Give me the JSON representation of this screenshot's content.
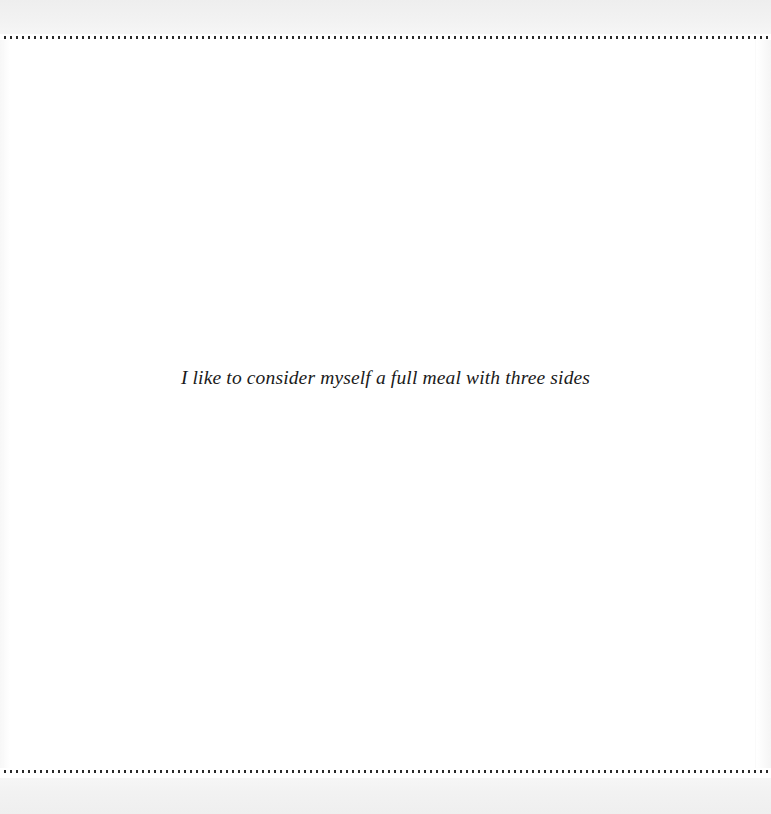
{
  "page": {
    "background_color": "#ffffff",
    "margin_band_color": "#f1f1f1"
  },
  "rules": {
    "top": {
      "style": "dotted",
      "color": "#2a2a2a",
      "name": "top-dotted-rule"
    },
    "bottom": {
      "style": "dotted",
      "color": "#2a2a2a",
      "name": "bottom-dotted-rule"
    }
  },
  "body": {
    "quote": "I like to consider myself a full meal with three sides",
    "text_color": "#1b1b1b",
    "alignment": "center",
    "style": "italic serif"
  }
}
